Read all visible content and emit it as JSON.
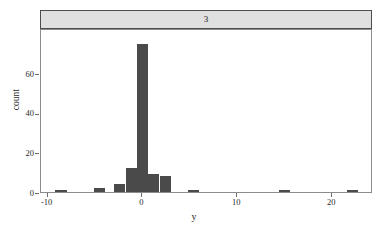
{
  "chart_data": {
    "type": "bar",
    "title": "3",
    "subtitle": "",
    "xlabel": "y",
    "ylabel": "count",
    "xlim": [
      -10.7,
      24.3
    ],
    "ylim": [
      0,
      83
    ],
    "grid": false,
    "legend": "none",
    "bin_width": 1.18,
    "xticks": [
      -10,
      0,
      10,
      20
    ],
    "xtick_labels": [
      "-10",
      "0",
      "10",
      "20"
    ],
    "yticks": [
      0,
      20,
      40,
      60
    ],
    "ytick_labels": [
      "0",
      "20",
      "40",
      "60"
    ],
    "bars": [
      {
        "x": -8.6,
        "value": 1
      },
      {
        "x": -4.5,
        "value": 2
      },
      {
        "x": -2.4,
        "value": 4
      },
      {
        "x": -1.2,
        "value": 12
      },
      {
        "x": 0.0,
        "value": 75
      },
      {
        "x": 1.2,
        "value": 9
      },
      {
        "x": 2.4,
        "value": 8
      },
      {
        "x": 5.4,
        "value": 1
      },
      {
        "x": 15.0,
        "value": 1
      },
      {
        "x": 22.1,
        "value": 1
      }
    ],
    "bar_color": "#4a4a4a",
    "strip_color": "#e0e0e0",
    "frame_color": "#8c8c8c"
  }
}
